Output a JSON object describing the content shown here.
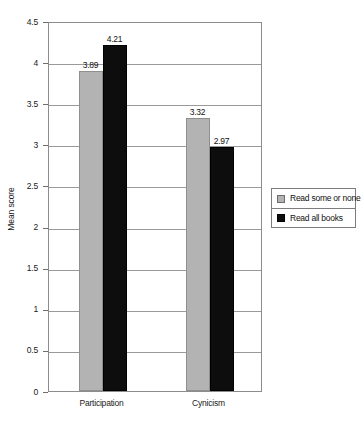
{
  "chart_data": {
    "type": "bar",
    "title": "",
    "subtitle": "",
    "xlabel": "",
    "ylabel": "Mean score",
    "categories": [
      "Participation",
      "Cynicism"
    ],
    "series": [
      {
        "name": "Read some or none",
        "color": "#b3b3b3",
        "values": [
          3.89,
          3.32
        ]
      },
      {
        "name": "Read all books",
        "color": "#0d0d0d",
        "values": [
          4.21,
          2.97
        ]
      }
    ],
    "value_labels": [
      [
        "3.89",
        "3.32"
      ],
      [
        "4.21",
        "2.97"
      ]
    ],
    "ylim": [
      0,
      4.5
    ],
    "ytick_values": [
      0,
      0.5,
      1,
      1.5,
      2,
      2.5,
      3,
      3.5,
      4,
      4.5
    ],
    "ytick_labels": [
      "0",
      "0.5",
      "1",
      "1.5",
      "2",
      "2.5",
      "3",
      "3.5",
      "4",
      "4.5"
    ],
    "grid": true,
    "grid_axis": "y",
    "legend_position": "right",
    "bar_group_mode": "grouped"
  }
}
